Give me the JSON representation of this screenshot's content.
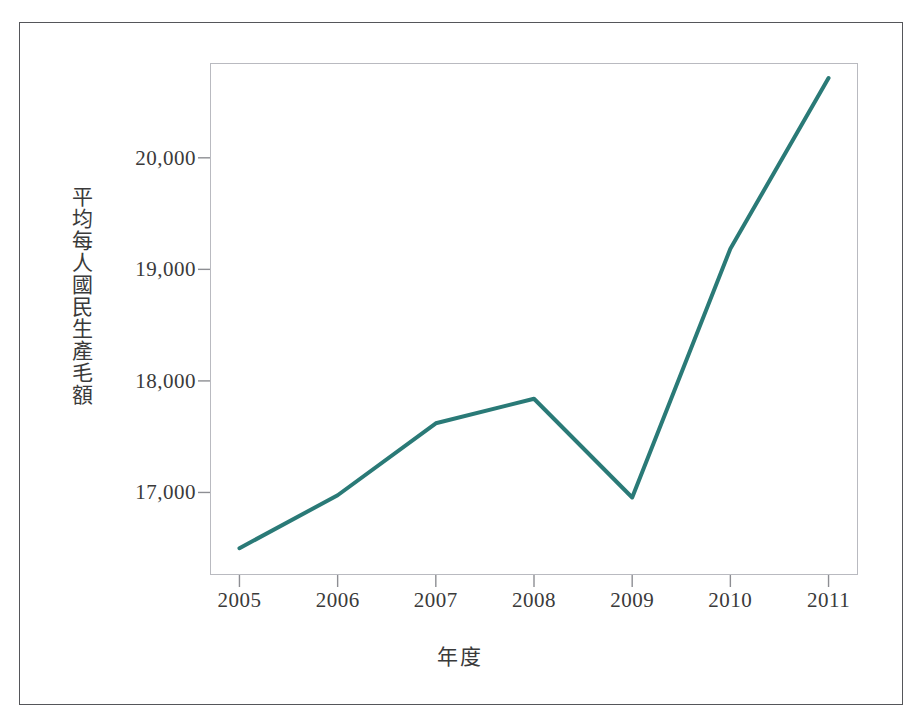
{
  "chart_data": {
    "type": "line",
    "title": "",
    "subtitle": "",
    "xlabel": "年度",
    "ylabel": "平均每人國民生產毛額",
    "categories": [
      "2005",
      "2006",
      "2007",
      "2008",
      "2009",
      "2010",
      "2011"
    ],
    "x": [
      2005,
      2006,
      2007,
      2008,
      2009,
      2010,
      2011
    ],
    "values": [
      16500,
      16975,
      17620,
      17840,
      16955,
      19185,
      20715
    ],
    "series": [
      {
        "name": "平均每人國民生產毛額",
        "values": [
          16500,
          16975,
          17620,
          17840,
          16955,
          19185,
          20715
        ],
        "color": "#2A7A77"
      }
    ],
    "ytick_labels": [
      "20,000",
      "19,000",
      "18,000",
      "17,000"
    ],
    "ytick_values": [
      20000,
      19000,
      18000,
      17000
    ],
    "xtick_labels": [
      "2005",
      "2006",
      "2007",
      "2008",
      "2009",
      "2010",
      "2011"
    ],
    "ylim": [
      16260,
      20850
    ],
    "xlim": [
      2004.7,
      2011.3
    ],
    "grid": false,
    "legend": false,
    "legend_position": "none",
    "annotations": []
  },
  "axes": {
    "y_title": "平均每人國民生產毛額",
    "x_title": "年度",
    "y_ticks": [
      {
        "label": "20,000",
        "value": 20000
      },
      {
        "label": "19,000",
        "value": 19000
      },
      {
        "label": "18,000",
        "value": 18000
      },
      {
        "label": "17,000",
        "value": 17000
      }
    ],
    "x_ticks": [
      {
        "label": "2005",
        "value": 2005
      },
      {
        "label": "2006",
        "value": 2006
      },
      {
        "label": "2007",
        "value": 2007
      },
      {
        "label": "2008",
        "value": 2008
      },
      {
        "label": "2009",
        "value": 2009
      },
      {
        "label": "2010",
        "value": 2010
      },
      {
        "label": "2011",
        "value": 2011
      }
    ]
  },
  "style": {
    "line_color": "#2A7A77",
    "line_width": 4,
    "plot_border_color": "#b9bac0",
    "outer_frame_color": "#55565a",
    "tick_color": "#8d8e93",
    "text_color": "#3a3a3a",
    "background": "#ffffff"
  }
}
